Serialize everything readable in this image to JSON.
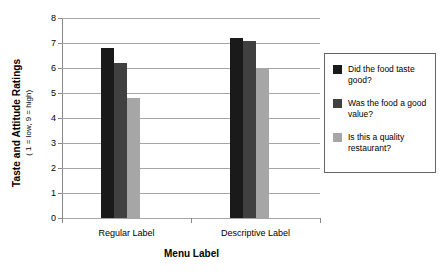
{
  "chart_data": {
    "type": "bar",
    "title": "",
    "xlabel": "Menu Label",
    "ylabel": "Taste and Attitude Ratings",
    "ylabel_sub": "( 1 = low, 9 = high)",
    "categories": [
      "Regular Label",
      "Descriptive Label"
    ],
    "ylim": [
      0,
      8
    ],
    "yticks": [
      0,
      1,
      2,
      3,
      4,
      5,
      6,
      7,
      8
    ],
    "grid": true,
    "legend_position": "right",
    "series": [
      {
        "name": "Did the food taste good?",
        "color": "#1a1a1a",
        "values": [
          6.8,
          7.2
        ]
      },
      {
        "name": "Was the food a good value?",
        "color": "#404040",
        "values": [
          6.2,
          7.1
        ]
      },
      {
        "name": "Is this a quality restaurant?",
        "color": "#a6a6a6",
        "values": [
          4.8,
          5.95
        ]
      }
    ]
  },
  "axis": {
    "grid_color": "#a6a6a6",
    "axis_color": "#888888"
  },
  "legend": {
    "border_color": "#666666"
  }
}
